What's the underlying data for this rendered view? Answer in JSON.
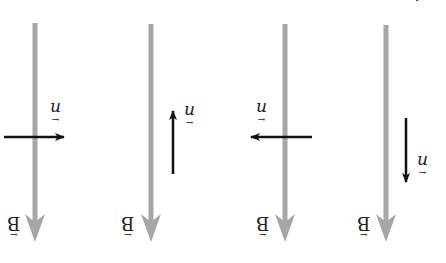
{
  "figure": {
    "orientation": "rotated 180 degrees",
    "top_caption_partial": "… 上 ХЕ ЗЭ ЛЧ …",
    "colors": {
      "field": "#a6a6a6",
      "vector": "#111111",
      "background": "#ffffff"
    },
    "panels": [
      {
        "id": 1,
        "field_label": "B",
        "vector_label": "n",
        "vector_direction": "right",
        "field_direction": "down"
      },
      {
        "id": 2,
        "field_label": "B",
        "vector_label": "n",
        "vector_direction": "up",
        "field_direction": "down"
      },
      {
        "id": 3,
        "field_label": "B",
        "vector_label": "n",
        "vector_direction": "left",
        "field_direction": "down"
      },
      {
        "id": 4,
        "field_label": "B",
        "vector_label": "n",
        "vector_direction": "down",
        "field_direction": "down"
      }
    ],
    "vector_arrow_glyph": "←"
  }
}
